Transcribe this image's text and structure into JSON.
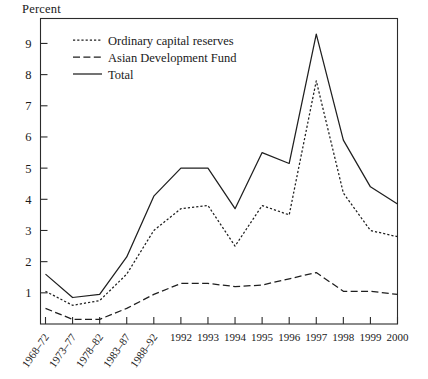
{
  "axis_title": "Percent",
  "legend": {
    "position": "top-left-inside",
    "items": [
      {
        "label": "Ordinary capital reserves",
        "style": "dotted",
        "key": "ordinary"
      },
      {
        "label": "Asian Development Fund",
        "style": "dashed",
        "key": "adf"
      },
      {
        "label": "Total",
        "style": "solid",
        "key": "total"
      }
    ]
  },
  "y_axis": {
    "labels": [
      "1",
      "2",
      "3",
      "4",
      "5",
      "6",
      "7",
      "8",
      "9"
    ],
    "values": [
      1,
      2,
      3,
      4,
      5,
      6,
      7,
      8,
      9
    ]
  },
  "x_axis": {
    "rotated_labels": [
      "1968–72",
      "1973–77",
      "1978–82",
      "1983–87",
      "1988–92"
    ],
    "horizontal_labels": [
      "1992",
      "1993",
      "1994",
      "1995",
      "1996",
      "1997",
      "1998",
      "1999",
      "2000"
    ]
  },
  "chart_data": {
    "type": "line",
    "title": "",
    "subtitle": "",
    "xlabel": "",
    "ylabel": "Percent",
    "ylim": [
      0,
      9.8
    ],
    "yticks": [
      1,
      2,
      3,
      4,
      5,
      6,
      7,
      8,
      9
    ],
    "grid": false,
    "legend_position": "upper left inside",
    "categories": [
      "1968–72",
      "1973–77",
      "1978–82",
      "1983–87",
      "1988–92",
      "1992",
      "1993",
      "1994",
      "1995",
      "1996",
      "1997",
      "1998",
      "1999",
      "2000"
    ],
    "series": [
      {
        "name": "Ordinary capital reserves",
        "style": "dotted",
        "values": [
          1.05,
          0.6,
          0.75,
          1.6,
          3.0,
          3.7,
          3.8,
          2.5,
          3.8,
          3.5,
          7.8,
          4.2,
          3.0,
          2.8
        ]
      },
      {
        "name": "Asian Development Fund",
        "style": "dashed",
        "values": [
          0.5,
          0.15,
          0.15,
          0.5,
          0.95,
          1.3,
          1.3,
          1.2,
          1.25,
          1.45,
          1.65,
          1.05,
          1.05,
          0.95
        ]
      },
      {
        "name": "Total",
        "style": "solid",
        "values": [
          1.6,
          0.85,
          0.95,
          2.15,
          4.1,
          5.0,
          5.0,
          3.7,
          5.5,
          5.15,
          9.3,
          5.9,
          4.4,
          3.85
        ]
      }
    ]
  }
}
